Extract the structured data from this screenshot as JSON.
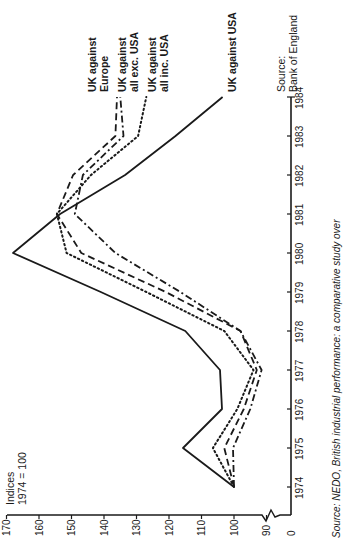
{
  "chart_data": {
    "type": "line",
    "orientation": "rotated-90-ccw",
    "title": "",
    "ylabel": "Indices 1974 = 100",
    "ylabel_lines": [
      "Indices",
      "1974 = 100"
    ],
    "xlabel": "",
    "x": [
      1974,
      1975,
      1976,
      1977,
      1978,
      1979,
      1980,
      1981,
      1982,
      1983,
      1984
    ],
    "x_tick_labels": [
      "1974",
      "1975",
      "1976",
      "1977",
      "1978",
      "1979",
      "1980",
      "1981",
      "1982",
      "1983",
      "1984"
    ],
    "y_ticks": [
      170,
      160,
      150,
      140,
      130,
      120,
      110,
      100,
      90,
      0
    ],
    "y_tick_labels": [
      "170",
      "160",
      "150",
      "140",
      "130",
      "120",
      "110",
      "100",
      "90",
      "0"
    ],
    "ylim": [
      85,
      170
    ],
    "axis_break": true,
    "grid": false,
    "series": [
      {
        "name": "UK against Europe",
        "label_lines": [
          "UK against",
          "Europe"
        ],
        "style": "dashed",
        "values": [
          100,
          103,
          97,
          93,
          98,
          121,
          147,
          154.5,
          149.5,
          136.5,
          136
        ]
      },
      {
        "name": "UK against all exc. USA",
        "label_lines": [
          "UK against",
          "all exc. USA"
        ],
        "style": "dash-dot",
        "values": [
          100,
          100.3,
          95,
          91.5,
          98,
          116.5,
          136.5,
          149,
          146.5,
          134,
          135
        ]
      },
      {
        "name": "UK against all inc. USA",
        "label_lines": [
          "UK against",
          "all inc. USA"
        ],
        "style": "dotted",
        "values": [
          100,
          106.5,
          99,
          94,
          103,
          127,
          151.5,
          154.5,
          144,
          129.5,
          127
        ]
      },
      {
        "name": "UK against USA",
        "label_lines": [
          "UK against USA"
        ],
        "style": "solid",
        "values": [
          100,
          115.7,
          103.7,
          104.3,
          115,
          141,
          168,
          153.5,
          133.5,
          118,
          103.5
        ]
      }
    ],
    "annotations": [
      {
        "text": "Source: Bank of England",
        "lines": [
          "Source:",
          "Bank of England"
        ]
      }
    ],
    "caption": "Source: NEDO, British industrial performance: a comparative study over"
  },
  "colors": {
    "ink": "#1a1a1a",
    "background": "#ffffff"
  }
}
